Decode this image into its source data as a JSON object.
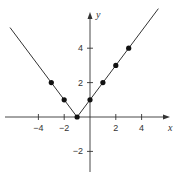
{
  "chart_data": {
    "type": "line",
    "title": "",
    "function": "y = |x + 1|",
    "xlabel": "x",
    "ylabel": "y",
    "xlim": [
      -6.5,
      6.5
    ],
    "ylim": [
      -3.6,
      6.5
    ],
    "x_ticks": [
      -4,
      -2,
      2,
      4
    ],
    "x_tick_labels": [
      "−4",
      "−2",
      "2",
      "4"
    ],
    "y_ticks": [
      4,
      2,
      -2
    ],
    "y_tick_labels": [
      "4",
      "2",
      "−2"
    ],
    "grid": false,
    "series": [
      {
        "name": "y = |x + 1|",
        "points": [
          {
            "x": -3,
            "y": 2
          },
          {
            "x": -2,
            "y": 1
          },
          {
            "x": -1,
            "y": 0
          },
          {
            "x": 0,
            "y": 1
          },
          {
            "x": 1,
            "y": 2
          },
          {
            "x": 2,
            "y": 3
          },
          {
            "x": 3,
            "y": 4
          }
        ],
        "line_extent_x": [
          -6.2,
          5.3
        ]
      }
    ],
    "colors": {
      "line": "#333333",
      "points": "#111111",
      "axes": "#333333"
    }
  }
}
